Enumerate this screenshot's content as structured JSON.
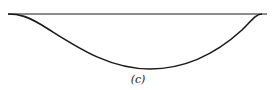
{
  "figure": {
    "label": "(c)",
    "line_color": "#1a1a1a",
    "baseline": {
      "x1": 8,
      "y1": 14,
      "x2": 267,
      "y2": 14
    },
    "curve": {
      "start": [
        8,
        14
      ],
      "minimum": [
        150,
        69
      ],
      "end": [
        262,
        14
      ]
    }
  }
}
